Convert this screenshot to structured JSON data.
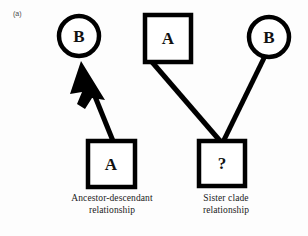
{
  "figure": {
    "panel_label": "(a)",
    "background_color": "#fdfdfd",
    "stroke_color": "#000000",
    "fill_color": "#ffffff"
  },
  "left_diagram": {
    "caption_line1": "Ancestor-descendant",
    "caption_line2": "relationship",
    "descendant_node_label": "B",
    "ancestor_node_label": "A",
    "descendant_node_shape": "circle",
    "ancestor_node_shape": "square",
    "connector": "arrow-pointing-up-left"
  },
  "right_diagram": {
    "caption_line1": "Sister clade",
    "caption_line2": "relationship",
    "left_taxon_label": "A",
    "right_taxon_label": "B",
    "common_ancestor_label": "?",
    "left_taxon_shape": "square",
    "right_taxon_shape": "circle",
    "common_ancestor_shape": "square",
    "connector": "v-shaped-clade-lines"
  }
}
